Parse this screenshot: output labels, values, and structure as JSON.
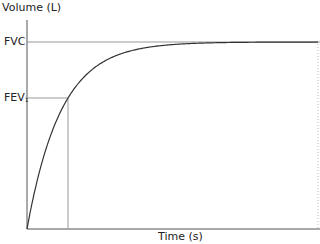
{
  "chart_data": {
    "type": "line",
    "title": "",
    "xlabel": "Time (s)",
    "ylabel": "Volume (L)",
    "y_ticks": [
      {
        "label": "FVC",
        "position": "plateau"
      },
      {
        "label": "FEV1",
        "display_main": "FEV",
        "display_sub": "1",
        "position": "volume at 1 second"
      }
    ],
    "x_ticks": [],
    "grid": false,
    "legend": null,
    "series": [
      {
        "name": "Expiratory volume-time curve",
        "shape": "exponential rise to plateau V(t) = FVC * (1 - e^(-k t))",
        "x_norm": [
          0,
          0.05,
          0.1,
          0.14,
          0.2,
          0.3,
          0.4,
          0.5,
          0.6,
          0.73,
          1.0
        ],
        "y_norm": [
          0,
          0.35,
          0.58,
          0.7,
          0.82,
          0.92,
          0.97,
          0.987,
          0.994,
          0.998,
          1.0
        ]
      }
    ],
    "annotations": [
      {
        "type": "hline",
        "label": "FVC",
        "y_norm": 1.0,
        "extent": "full width"
      },
      {
        "type": "hline",
        "label": "FEV1",
        "y_norm": 0.7,
        "extent": "axis to curve"
      },
      {
        "type": "vline",
        "label": "1 s",
        "x_norm": 0.14,
        "extent": "curve to x-axis"
      },
      {
        "type": "vline",
        "style": "dotted",
        "x_norm": 1.0,
        "extent": "faint right boundary"
      }
    ],
    "ylim": [
      0,
      1
    ],
    "xlim": [
      0,
      1
    ]
  },
  "labels": {
    "ylabel": "Volume (L)",
    "xlabel": "Time (s)",
    "fvc": "FVC",
    "fev_main": "FEV",
    "fev_sub": "1"
  },
  "colors": {
    "axis": "#555555",
    "curve": "#333333",
    "guide": "#999999",
    "text": "#222222"
  }
}
